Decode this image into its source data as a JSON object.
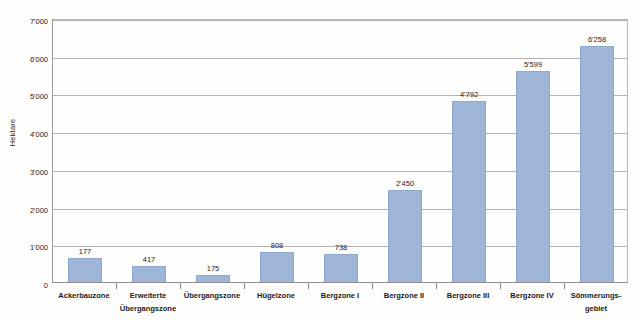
{
  "scan_artifact": {
    "top_sliver_text": "·  ·                                            ·                        · ·"
  },
  "chart_data": {
    "type": "bar",
    "title": "",
    "subtitle": "",
    "xlabel": "",
    "ylabel": "Hektare",
    "grid": true,
    "legend": "none",
    "orientation": "vertical",
    "ylim": [
      0,
      7000
    ],
    "ytick_step": 1000,
    "ytick_labels": [
      "0",
      "1'000",
      "2'000",
      "3'000",
      "4'000",
      "5'000",
      "6'000",
      "7'000"
    ],
    "ytick_values": [
      0,
      1000,
      2000,
      3000,
      4000,
      5000,
      6000,
      7000
    ],
    "thousands_separator": "'",
    "categories": [
      "Ackerbauzone",
      "Erweiterte\nÜbergangszone",
      "Übergangszone",
      "Hügelzone",
      "Bergzone I",
      "Bergzone II",
      "Bergzone III",
      "Bergzone IV",
      "Sömmerungs-\ngebiet"
    ],
    "values": [
      177,
      417,
      175,
      808,
      738,
      2450,
      4792,
      5599,
      6258
    ],
    "value_labels": [
      "177",
      "417",
      "175",
      "808",
      "738",
      "2'450",
      "4'792",
      "5'599",
      "6'258"
    ],
    "plotted_heights": [
      650,
      417,
      175,
      808,
      738,
      2450,
      4792,
      5599,
      6258
    ],
    "bar_color": "#9fb6d8",
    "bar_border_color": "#8fa8ce",
    "gridline_color": "#b3b3b3",
    "axis_color": "#8e8e8e",
    "background_color": "#fdfdfb"
  }
}
